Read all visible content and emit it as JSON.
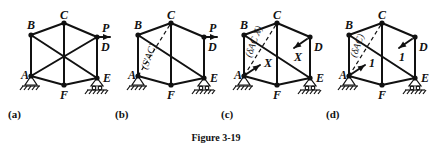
{
  "figure": {
    "title": "Figure 3-19",
    "node_labels": [
      "A",
      "B",
      "C",
      "D",
      "E",
      "F"
    ],
    "load_label": "P",
    "panels": [
      {
        "id": "a",
        "caption": "(a)",
        "members": [
          "AB",
          "BC",
          "CD",
          "DE",
          "EF",
          "FA",
          "CF",
          "BE",
          "AD"
        ],
        "dashed_members": [],
        "loads": [
          {
            "at": "D",
            "label": "P",
            "direction": "right"
          }
        ],
        "annotation": ""
      },
      {
        "id": "b",
        "caption": "(b)",
        "members": [
          "AB",
          "BC",
          "CD",
          "DE",
          "EF",
          "FA",
          "CF",
          "BE"
        ],
        "dashed_members": [
          "AC"
        ],
        "loads": [
          {
            "at": "D",
            "label": "P",
            "direction": "right"
          }
        ],
        "annotation": "(S'AC)"
      },
      {
        "id": "c",
        "caption": "(c)",
        "members": [
          "AB",
          "BC",
          "CD",
          "DE",
          "EF",
          "FA",
          "CF",
          "BE"
        ],
        "dashed_members": [
          "AC"
        ],
        "loads": [
          {
            "at": "A",
            "label": "X",
            "direction": "toward-D"
          },
          {
            "at": "D",
            "label": "X",
            "direction": "toward-A"
          }
        ],
        "annotation": "(δAC X)"
      },
      {
        "id": "d",
        "caption": "(d)",
        "members": [
          "AB",
          "BC",
          "CD",
          "DE",
          "EF",
          "FA",
          "CF",
          "BE"
        ],
        "dashed_members": [
          "AC"
        ],
        "loads": [
          {
            "at": "A",
            "label": "1",
            "direction": "toward-D"
          },
          {
            "at": "D",
            "label": "1",
            "direction": "toward-A"
          }
        ],
        "annotation": "(δAC)"
      }
    ]
  }
}
